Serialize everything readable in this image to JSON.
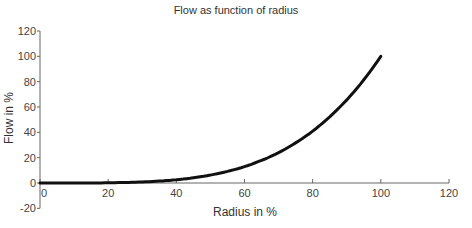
{
  "chart_data": {
    "type": "line",
    "title": "Flow as function of radius",
    "xlabel": "Radius in %",
    "ylabel": "Flow in %",
    "xlim": [
      0,
      120
    ],
    "ylim": [
      -20,
      120
    ],
    "xticks": [
      0,
      20,
      40,
      60,
      80,
      100,
      120
    ],
    "yticks": [
      -20,
      0,
      20,
      40,
      60,
      80,
      100,
      120
    ],
    "grid": false,
    "legend": null,
    "series": [
      {
        "name": "Flow",
        "color": "#111111",
        "x": [
          0,
          10,
          20,
          30,
          40,
          50,
          60,
          70,
          80,
          90,
          100
        ],
        "y": [
          0,
          0.01,
          0.16,
          0.81,
          2.56,
          6.25,
          12.96,
          24.01,
          40.96,
          65.61,
          100
        ]
      }
    ]
  }
}
